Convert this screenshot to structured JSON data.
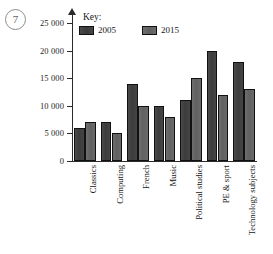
{
  "question": {
    "number": "7"
  },
  "chart_data": {
    "type": "bar",
    "title": "",
    "xlabel": "",
    "ylabel": "",
    "ylim": [
      0,
      25000
    ],
    "ytick_values": [
      0,
      5000,
      10000,
      15000,
      20000,
      25000
    ],
    "ytick_labels": [
      "0",
      "5 000",
      "10 000",
      "15 000",
      "20 000",
      "25 000"
    ],
    "grid": false,
    "legend_position": "top-center",
    "legend_title": "Key:",
    "categories": [
      "Classics",
      "Computing",
      "French",
      "Music",
      "Political studies",
      "PE & sport",
      "Technology subjects"
    ],
    "series": [
      {
        "name": "2005",
        "color": "#3f3f3f",
        "values": [
          6000,
          7000,
          14000,
          10000,
          11000,
          20000,
          18000
        ]
      },
      {
        "name": "2015",
        "color": "#686868",
        "values": [
          7000,
          5000,
          10000,
          8000,
          15000,
          12000,
          13000
        ]
      }
    ]
  }
}
